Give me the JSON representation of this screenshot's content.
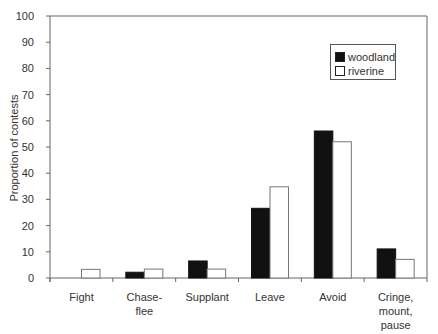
{
  "chart_data": {
    "type": "bar",
    "title": "",
    "xlabel": "",
    "ylabel": "Proportion of contests",
    "ylim": [
      0,
      100
    ],
    "yticks": [
      0,
      10,
      20,
      30,
      40,
      50,
      60,
      70,
      80,
      90,
      100
    ],
    "grid": false,
    "legend_position": "upper right (inside)",
    "categories": [
      "Fight",
      "Chase-\nflee",
      "Supplant",
      "Leave",
      "Avoid",
      "Cringe,\nmount,\npause"
    ],
    "series": [
      {
        "name": "woodland",
        "color": "#111111",
        "values": [
          0,
          2.2,
          6.5,
          26.6,
          56.1,
          11.1
        ]
      },
      {
        "name": "riverine",
        "color": "#ffffff",
        "values": [
          3.3,
          3.4,
          3.4,
          34.8,
          52.0,
          7.1
        ]
      }
    ]
  },
  "legend": {
    "items": [
      {
        "label": "woodland",
        "color": "#111111"
      },
      {
        "label": "riverine",
        "color": "#ffffff"
      }
    ]
  }
}
